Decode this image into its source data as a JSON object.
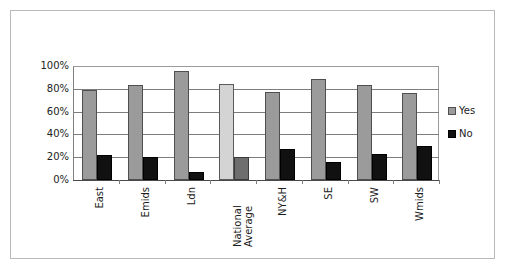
{
  "chart_data": {
    "type": "bar",
    "title": "",
    "subtitle": "",
    "xlabel": "",
    "ylabel": "",
    "ylim": [
      0,
      100
    ],
    "ytick_labels": [
      "100%",
      "80%",
      "60%",
      "40%",
      "20%",
      "0%"
    ],
    "ytick_values": [
      100,
      80,
      60,
      40,
      20,
      0
    ],
    "grid": true,
    "legend_position": "right",
    "categories": [
      "East",
      "Emids",
      "Ldn",
      "National Average",
      "NY&H",
      "SE",
      "SW",
      "Wmids"
    ],
    "category_label_lines": [
      [
        "East"
      ],
      [
        "Emids"
      ],
      [
        "Ldn"
      ],
      [
        "National",
        "Average"
      ],
      [
        "NY&H"
      ],
      [
        "SE"
      ],
      [
        "SW"
      ],
      [
        "Wmids"
      ]
    ],
    "series": [
      {
        "name": "Yes",
        "color": "#9b9b9b",
        "values": [
          79,
          83,
          96,
          84,
          77,
          89,
          83,
          76
        ]
      },
      {
        "name": "No",
        "color": "#111111",
        "values": [
          22,
          20,
          7,
          20,
          27,
          16,
          23,
          30
        ]
      }
    ],
    "highlighted_category": "National Average",
    "highlight_colors": {
      "Yes": "#d4d4d4",
      "No": "#6e6e6e"
    },
    "legend": [
      {
        "label": "Yes",
        "color": "#9b9b9b"
      },
      {
        "label": "No",
        "color": "#111111"
      }
    ]
  }
}
